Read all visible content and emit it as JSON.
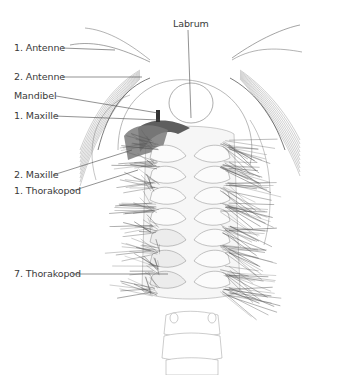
{
  "figure": {
    "labels": [
      {
        "id": "labrum",
        "text": "Labrum"
      },
      {
        "id": "antenne-1",
        "text": "1. Antenne"
      },
      {
        "id": "antenne-2",
        "text": "2. Antenne"
      },
      {
        "id": "mandibel",
        "text": "Mandibel"
      },
      {
        "id": "maxille-1",
        "text": "1. Maxille"
      },
      {
        "id": "maxille-2",
        "text": "2. Maxille"
      },
      {
        "id": "thorakopod-1",
        "text": "1. Thorakopod"
      },
      {
        "id": "thorakopod-7",
        "text": "7. Thorakopod"
      }
    ],
    "colors": {
      "line": "#4a4a4a",
      "setae": "#555555",
      "highlight": "#5e5e5e",
      "body_fill": "#f2f2f2",
      "label": "#3a3a3a"
    }
  }
}
